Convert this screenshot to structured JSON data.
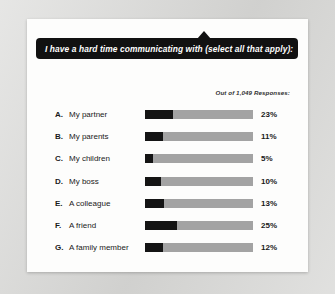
{
  "card": {
    "banner": {
      "question": "I have a hard time communicating with (select all that apply):"
    },
    "subtitle": "Out of 1,049 Responses:"
  },
  "chart_data": {
    "type": "bar",
    "title": "I have a hard time communicating with (select all that apply):",
    "subtitle": "Out of 1,049 Responses:",
    "xlabel": "",
    "ylabel": "",
    "xlim": [
      0,
      100
    ],
    "grid": false,
    "legend": "none",
    "orientation": "horizontal",
    "value_suffix": "%",
    "total_responses": "1,049",
    "categories": [
      "My partner",
      "My parents",
      "My children",
      "My boss",
      "A colleague",
      "A friend",
      "A family member"
    ],
    "letters": [
      "A.",
      "B.",
      "C.",
      "D.",
      "E.",
      "F.",
      "G."
    ],
    "values": [
      23,
      11,
      5,
      10,
      13,
      25,
      12
    ],
    "value_labels": [
      "23%",
      "11%",
      "5%",
      "10%",
      "13%",
      "25%",
      "12%"
    ],
    "rows": [
      {
        "letter": "A.",
        "label": "My partner",
        "value": 23,
        "value_label": "23%",
        "fill_width_pct": 26
      },
      {
        "letter": "B.",
        "label": "My parents",
        "value": 11,
        "value_label": "11%",
        "fill_width_pct": 17
      },
      {
        "letter": "C.",
        "label": "My children",
        "value": 5,
        "value_label": "5%",
        "fill_width_pct": 7
      },
      {
        "letter": "D.",
        "label": "My boss",
        "value": 10,
        "value_label": "10%",
        "fill_width_pct": 15
      },
      {
        "letter": "E.",
        "label": "A colleague",
        "value": 13,
        "value_label": "13%",
        "fill_width_pct": 18
      },
      {
        "letter": "F.",
        "label": "A friend",
        "value": 25,
        "value_label": "25%",
        "fill_width_pct": 30
      },
      {
        "letter": "G.",
        "label": "A family member",
        "value": 12,
        "value_label": "12%",
        "fill_width_pct": 17
      }
    ],
    "colors": {
      "bar_fill": "#141414",
      "bar_track": "#a3a3a3",
      "banner_background": "#111111",
      "banner_text": "#ffffff",
      "card_background": "#fdfdfc",
      "page_background": "#d9d9d7",
      "text": "#1a1a1a"
    }
  }
}
